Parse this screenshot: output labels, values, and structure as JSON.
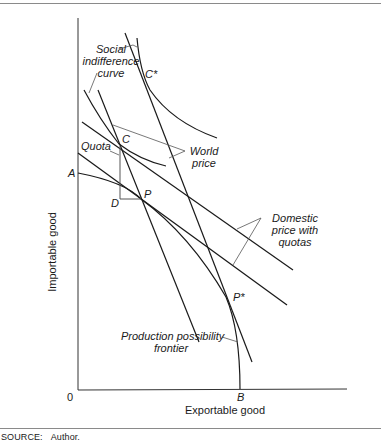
{
  "figure": {
    "axes": {
      "x_label": "Exportable good",
      "y_label": "Importable good",
      "origin_label": "0"
    },
    "points": {
      "A": "A",
      "B": "B",
      "C": "C",
      "C_star": "C*",
      "D": "D",
      "P": "P",
      "P_star": "P*"
    },
    "annotations": {
      "social_indifference_curve": [
        "Social",
        "indifference",
        "curve"
      ],
      "world_price": [
        "World",
        "price"
      ],
      "quota": "Quota",
      "domestic_price": [
        "Domestic",
        "price  with",
        "quotas"
      ],
      "ppf": [
        "Production  possibility",
        "frontier"
      ]
    },
    "source": {
      "label": "SOURCE:",
      "value": "Author."
    }
  },
  "colors": {
    "line": "#1a1a1a",
    "leader": "#555555",
    "rule": "#8a8a8a"
  }
}
